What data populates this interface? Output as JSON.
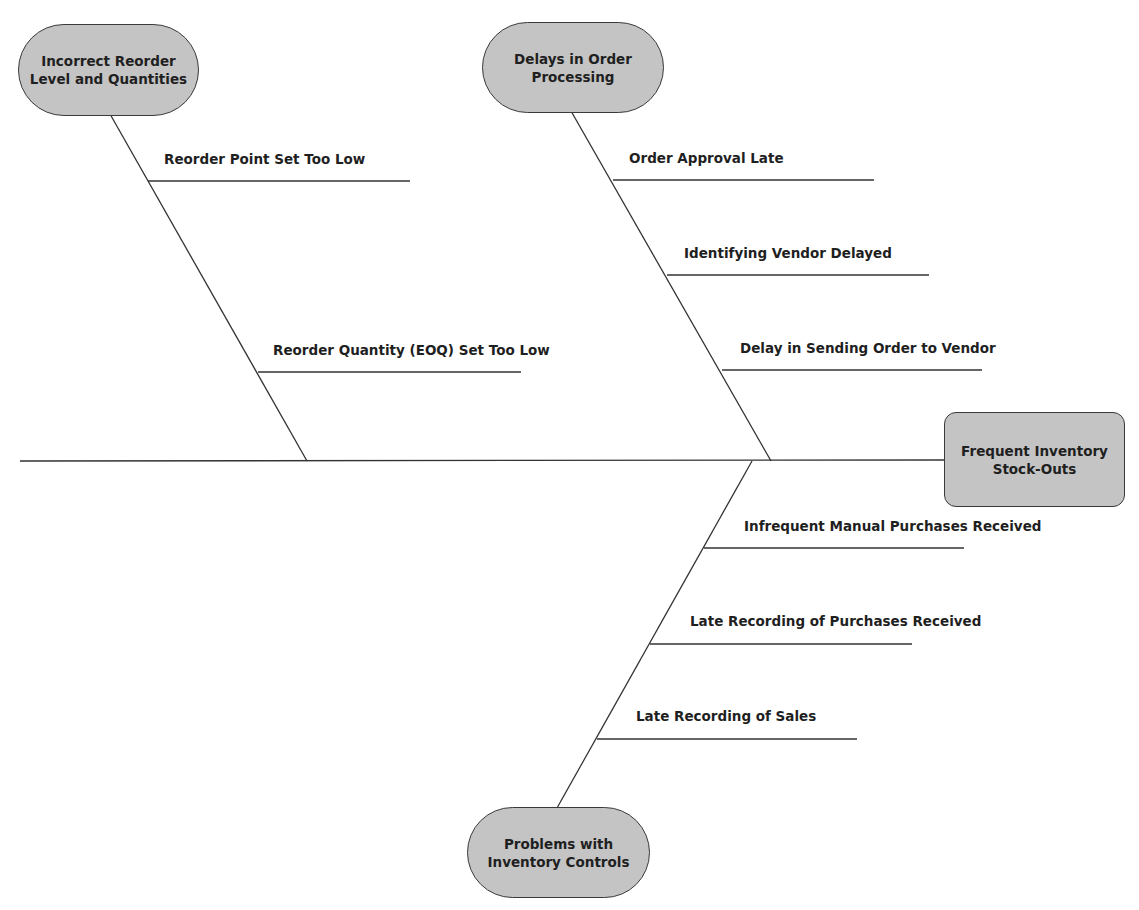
{
  "diagram": {
    "type": "fishbone",
    "effect": {
      "line1": "Frequent Inventory",
      "line2": "Stock-Outs"
    },
    "categories": [
      {
        "id": "incorrect-reorder",
        "line1": "Incorrect Reorder",
        "line2": "Level and Quantities",
        "causes": [
          "Reorder Point Set Too Low",
          "Reorder Quantity (EOQ) Set Too Low"
        ]
      },
      {
        "id": "delays-order-processing",
        "line1": "Delays in Order",
        "line2": "Processing",
        "causes": [
          "Order Approval Late",
          "Identifying Vendor Delayed",
          "Delay in Sending Order to Vendor"
        ]
      },
      {
        "id": "problems-inventory-controls",
        "line1": "Problems with",
        "line2": "Inventory Controls",
        "causes": [
          "Infrequent Manual Purchases Received",
          "Late Recording of Purchases Received",
          "Late Recording of Sales"
        ]
      }
    ]
  },
  "colors": {
    "node_fill": "#c4c4c4",
    "node_border": "#3a3a3a",
    "line": "#333333",
    "text": "#1f1f1f"
  }
}
